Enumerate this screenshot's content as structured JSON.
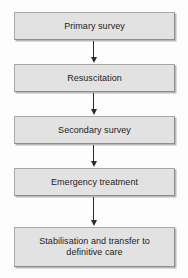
{
  "diagram": {
    "orientation": "vertical-top-down",
    "background_color": "#fdfdfd",
    "node_fill_color": "#e2e2e2",
    "node_border_color": "#a8a8a8",
    "arrow_color": "#2b2b2b",
    "text_color": "#1d1d1d",
    "nodes": [
      {
        "id": "primary-survey",
        "label": "Primary survey",
        "lines": 1
      },
      {
        "id": "resuscitation",
        "label": "Resuscitation",
        "lines": 1
      },
      {
        "id": "secondary-survey",
        "label": "Secondary survey",
        "lines": 1
      },
      {
        "id": "emergency-treatment",
        "label": "Emergency treatment",
        "lines": 1
      },
      {
        "id": "stabilisation-transfer",
        "label": "Stabilisation and transfer to\ndefinitive care",
        "lines": 2
      }
    ],
    "connectors": [
      {
        "id": "arrow-1",
        "from": "primary-survey",
        "to": "resuscitation",
        "style": "solid-arrow-down"
      },
      {
        "id": "arrow-2",
        "from": "resuscitation",
        "to": "secondary-survey",
        "style": "solid-arrow-down"
      },
      {
        "id": "arrow-3",
        "from": "secondary-survey",
        "to": "emergency-treatment",
        "style": "solid-arrow-down"
      },
      {
        "id": "arrow-4",
        "from": "emergency-treatment",
        "to": "stabilisation-transfer",
        "style": "solid-arrow-down"
      }
    ]
  }
}
